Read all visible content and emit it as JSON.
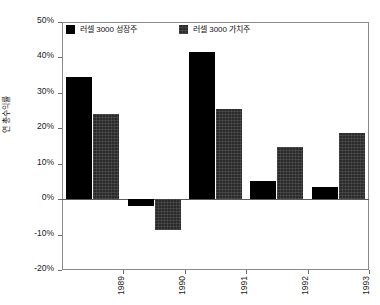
{
  "chart_data": {
    "type": "bar",
    "title": "",
    "subtitle": "",
    "xlabel": "",
    "ylabel": "연 총수익률",
    "categories": [
      "1989",
      "1990",
      "1991",
      "1992",
      "1993"
    ],
    "series": [
      {
        "name": "러셀 3000 성장주",
        "color": "#000000",
        "values": [
          34.5,
          -2.0,
          41.5,
          5.0,
          3.5
        ]
      },
      {
        "name": "러셀 3000 가치주",
        "color": "#2b2b2b",
        "values": [
          24.0,
          -8.7,
          25.5,
          14.8,
          18.7
        ]
      }
    ],
    "ylim": [
      -20,
      50
    ],
    "ytick_step": 10,
    "ytick_labels": [
      "50%",
      "40%",
      "30%",
      "20%",
      "10%",
      "0%",
      "-10%",
      "-20%"
    ],
    "ytick_values": [
      50,
      40,
      30,
      20,
      10,
      0,
      -10,
      -20
    ],
    "grid": false,
    "legend_position": "top-inside-left",
    "value_suffix": "%"
  },
  "legend": {
    "entries": [
      {
        "label": "러셀 3000 성장주",
        "swatch": "growth-swatch"
      },
      {
        "label": "러셀 3000 가치주",
        "swatch": "value-swatch"
      }
    ]
  },
  "axes": {
    "y_title": "연 총수익률"
  }
}
